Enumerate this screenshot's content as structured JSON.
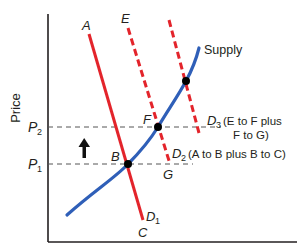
{
  "diagram": {
    "y_axis_label": "Price",
    "x_axis_label": "",
    "price_levels": [
      {
        "id": "p1",
        "main": "P",
        "sub": "1"
      },
      {
        "id": "p2",
        "main": "P",
        "sub": "2"
      }
    ],
    "curves": {
      "supply": {
        "label": "Supply",
        "color": "#2f5fb8"
      },
      "d1": {
        "main": "D",
        "sub": "1",
        "color": "#e3242b",
        "style": "solid"
      },
      "d2": {
        "main": "D",
        "sub": "2",
        "note": "(A to B plus B to C)",
        "color": "#e3242b",
        "style": "dashed"
      },
      "d3": {
        "main": "D",
        "sub": "3",
        "note_line1": "(E to F plus",
        "note_line2": "F to G)",
        "color": "#e3242b",
        "style": "dashed"
      }
    },
    "points": {
      "A": "A",
      "B": "B",
      "C": "C",
      "E": "E",
      "F": "F",
      "G": "G"
    },
    "arrow": {
      "direction": "up",
      "meaning": "price increase from P1 to P2"
    },
    "colors": {
      "axis": "#231f20",
      "guide": "#555555",
      "demand": "#e3242b",
      "supply": "#2f5fb8",
      "point": "#000000"
    }
  }
}
